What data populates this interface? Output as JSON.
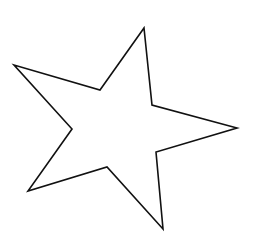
{
  "canvas": {
    "width": 253,
    "height": 234,
    "background": "#ffffff"
  },
  "shape": {
    "type": "five-pointed-star",
    "fill": "#ffffff",
    "stroke": "#111111",
    "stroke_width": 1.6,
    "vertices": [
      [
        144,
        28
      ],
      [
        152,
        105
      ],
      [
        237,
        128
      ],
      [
        156,
        152
      ],
      [
        163,
        229
      ],
      [
        107,
        167
      ],
      [
        28,
        191
      ],
      [
        72,
        129
      ],
      [
        14,
        65
      ],
      [
        100,
        90
      ]
    ],
    "points_attr": "144,28 152,105 237,128 156,152 163,229 107,167 28,191 72,129 14,65 100,90"
  }
}
